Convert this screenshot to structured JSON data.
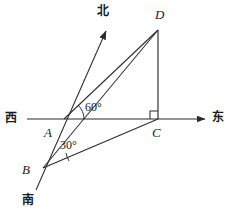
{
  "figure": {
    "kind": "plane-geometry-diagram",
    "title": "",
    "background_color": "#ffffff",
    "stroke_color": "#2b2b2b",
    "text_color": "#1a1a1a",
    "width": 234,
    "height": 216,
    "points": {
      "A": {
        "label": "A",
        "x": 64,
        "y": 119,
        "label_x": 44,
        "label_y": 133
      },
      "B": {
        "label": "B",
        "x": 43,
        "y": 168,
        "label_x": 22,
        "label_y": 170
      },
      "C": {
        "label": "C",
        "x": 158,
        "y": 119,
        "label_x": 152,
        "label_y": 134
      },
      "D": {
        "label": "D",
        "x": 158,
        "y": 30,
        "label_x": 155,
        "label_y": 14
      }
    },
    "compass": {
      "north": {
        "label": "北",
        "label_x": 98,
        "label_y": 10,
        "tip_x": 106,
        "tip_y": 31
      },
      "south": {
        "label": "南",
        "label_x": 23,
        "label_y": 196,
        "tip_x": 36,
        "tip_y": 190
      },
      "west": {
        "label": "西",
        "label_x": 6,
        "label_y": 112
      },
      "east": {
        "label": "东",
        "label_x": 213,
        "label_y": 112,
        "tip_x": 205,
        "tip_y": 119
      }
    },
    "angles": [
      {
        "name": "angle-at-A",
        "value": "60°",
        "label_x": 82,
        "label_y": 104,
        "vertex": "A"
      },
      {
        "name": "angle-at-B",
        "value": "30°",
        "label_x": 60,
        "label_y": 142,
        "vertex": "B"
      }
    ],
    "right_angle": {
      "at": "C",
      "marker": "square"
    },
    "segments": [
      {
        "name": "west-east-axis",
        "from": "west-end",
        "to": "east-arrow"
      },
      {
        "name": "south-north-line",
        "from": "B-south",
        "to": "north-arrow"
      },
      {
        "name": "segment-AD",
        "from": "A",
        "to": "D"
      },
      {
        "name": "segment-BD",
        "from": "B",
        "to": "D"
      },
      {
        "name": "segment-BC",
        "from": "B",
        "to": "C"
      },
      {
        "name": "segment-CD",
        "from": "C",
        "to": "D"
      }
    ]
  }
}
